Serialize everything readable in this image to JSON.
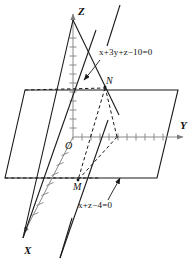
{
  "figure": {
    "type": "3d-coordinate-diagram",
    "axes": [
      {
        "name": "X",
        "label": "X",
        "direction": "down-left"
      },
      {
        "name": "Y",
        "label": "Y",
        "direction": "right"
      },
      {
        "name": "Z",
        "label": "Z",
        "direction": "up"
      }
    ],
    "origin_label": "O",
    "points": [
      {
        "name": "N",
        "label": "N"
      },
      {
        "name": "M",
        "label": "M"
      }
    ],
    "annotations": [
      {
        "name": "plane-1-equation",
        "text": "x+3y+z−10=0"
      },
      {
        "name": "plane-2-equation",
        "text": "x+z−4=0"
      }
    ],
    "colors": {
      "stroke": "#1a1a1a",
      "axis_gray": "#8a8a8a",
      "background": "#ffffff"
    }
  }
}
